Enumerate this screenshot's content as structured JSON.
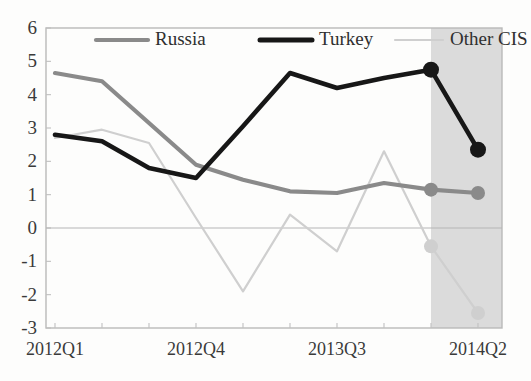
{
  "chart_data": {
    "type": "line",
    "title": "",
    "xlabel": "",
    "ylabel": "",
    "ylim": [
      -3,
      6
    ],
    "ytick_labels": [
      "6",
      "5",
      "4",
      "3",
      "2",
      "1",
      "0",
      "-1",
      "-2",
      "-3"
    ],
    "ytick_values": [
      6,
      5,
      4,
      3,
      2,
      1,
      0,
      -1,
      -2,
      -3
    ],
    "grid": false,
    "legend_position": "top-inside",
    "x": [
      "2012Q1",
      "2012Q2",
      "2012Q3",
      "2012Q4",
      "2013Q1",
      "2013Q2",
      "2013Q3",
      "2013Q4",
      "2014Q1",
      "2014Q2"
    ],
    "xtick_labels": [
      "2012Q1",
      "2012Q4",
      "2013Q3",
      "2014Q2"
    ],
    "xtick_indices": [
      0,
      3,
      6,
      9
    ],
    "series": [
      {
        "name": "Russia",
        "color": "#8a8a8a",
        "values": [
          4.65,
          4.4,
          3.15,
          1.9,
          1.45,
          1.1,
          1.05,
          1.35,
          1.15,
          1.05
        ],
        "marker_indices": [
          8,
          9
        ]
      },
      {
        "name": "Turkey",
        "color": "#171717",
        "values": [
          2.8,
          2.6,
          1.8,
          1.5,
          3.05,
          4.65,
          4.2,
          4.5,
          4.75,
          2.35
        ],
        "marker_indices": [
          8,
          9
        ]
      },
      {
        "name": "Other CIS",
        "color": "#cfcfcf",
        "values": [
          2.7,
          2.95,
          2.55,
          0.3,
          -1.9,
          0.4,
          -0.7,
          2.3,
          -0.55,
          -2.55
        ],
        "marker_indices": [
          8,
          9
        ]
      }
    ],
    "shaded_region": {
      "label": "forecast",
      "from_index": 8,
      "to_index": 9,
      "color": "#c6c6c6"
    }
  },
  "legend": {
    "items": [
      {
        "label": "Russia",
        "color": "#8a8a8a"
      },
      {
        "label": "Turkey",
        "color": "#171717"
      },
      {
        "label": "Other CIS",
        "color": "#cfcfcf"
      }
    ]
  }
}
